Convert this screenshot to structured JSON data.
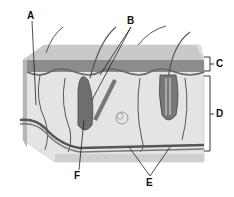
{
  "diagram": {
    "type": "skin cross-section",
    "labels": {
      "A": "A",
      "B": "B",
      "C": "C",
      "D": "D",
      "E": "E",
      "F": "F"
    }
  },
  "colors": {
    "epidermis": "#8a8a8a",
    "epidermis_top": "#c8c8c8",
    "dermis": "#e6e6e6",
    "vessel": "#555555",
    "outline": "#333333"
  }
}
